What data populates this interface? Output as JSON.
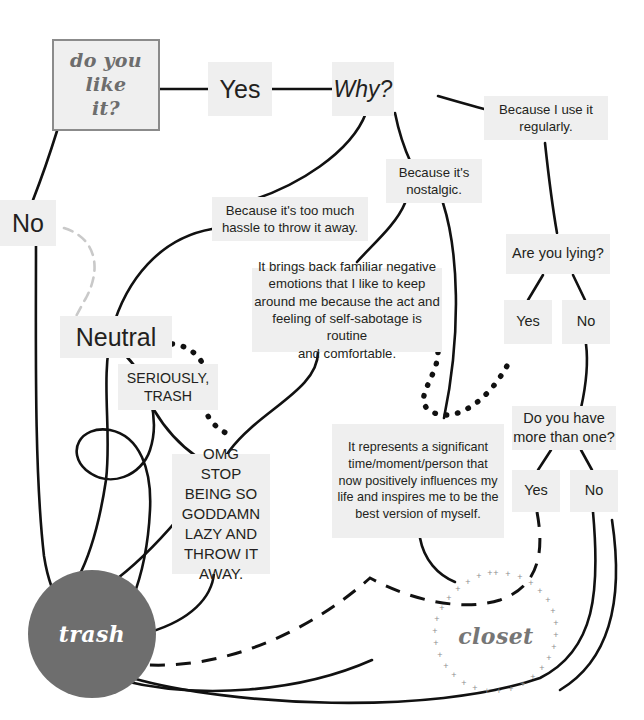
{
  "diagram": {
    "colors": {
      "node_fill": "#efefef",
      "node_text": "#231f20",
      "start_border": "#8b8b8b",
      "start_text": "#6d6d6d",
      "trash_fill": "#6e6e6e",
      "trash_text": "#ffffff",
      "closet_text": "#767676",
      "edge_solid": "#111111",
      "edge_dashed_gray": "#c9c9c9",
      "background": "#ffffff"
    },
    "nodes": {
      "start": "do you\nlike\nit?",
      "yes": "Yes",
      "why": "Why?",
      "no": "No",
      "neutral": "Neutral",
      "because_regularly": "Because I use it\nregularly.",
      "because_hassle": "Because it's too much\nhassle to throw it away.",
      "because_nostalgic": "Because it's\nnostalgic.",
      "negative_emotions": "It brings back familiar negative\nemotions that I like to keep\naround me because the act and\nfeeling of self-sabotage is routine\nand comfortable.",
      "represents_significant": "It represents a significant\ntime/moment/person that\nnow positively influences my\nlife and inspires me to be the\nbest version of myself.",
      "are_you_lying": "Are you lying?",
      "lying_yes": "Yes",
      "lying_no": "No",
      "more_than_one": "Do you have\nmore than one?",
      "more_yes": "Yes",
      "more_no": "No",
      "seriously_trash": "SERIOUSLY,\nTRASH",
      "omg_stop": "OMG\nSTOP\nBEING SO\nGODDAMN\nLAZY AND\nTHROW IT\nAWAY.",
      "trash": "trash",
      "closet": "closet"
    }
  }
}
